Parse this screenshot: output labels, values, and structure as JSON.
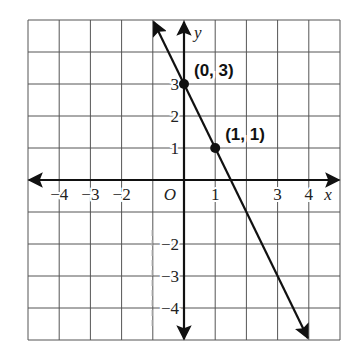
{
  "chart_data": {
    "type": "line",
    "title": "",
    "xlabel": "x",
    "ylabel": "y",
    "xlim": [
      -5,
      5
    ],
    "ylim": [
      -5,
      5
    ],
    "grid": true,
    "origin_label": "O",
    "x_tick_labels": [
      {
        "value": -4,
        "label": "−4"
      },
      {
        "value": -3,
        "label": "−3"
      },
      {
        "value": -2,
        "label": "−2"
      },
      {
        "value": 1,
        "label": "1"
      },
      {
        "value": 3,
        "label": "3"
      },
      {
        "value": 4,
        "label": "4"
      }
    ],
    "y_tick_labels": [
      {
        "value": 3,
        "label": "3"
      },
      {
        "value": 2,
        "label": "2"
      },
      {
        "value": 1,
        "label": "1"
      },
      {
        "value": -2,
        "label": "−2"
      },
      {
        "value": -3,
        "label": "−3"
      },
      {
        "value": -4,
        "label": "−4"
      }
    ],
    "series": [
      {
        "name": "y = -2x + 3",
        "slope": -2,
        "intercept": 3,
        "x": [
          -1,
          4
        ],
        "y": [
          5,
          -5
        ],
        "arrows": "both"
      }
    ],
    "points": [
      {
        "x": 0,
        "y": 3,
        "label": "(0, 3)"
      },
      {
        "x": 1,
        "y": 1,
        "label": "(1, 1)"
      }
    ]
  }
}
